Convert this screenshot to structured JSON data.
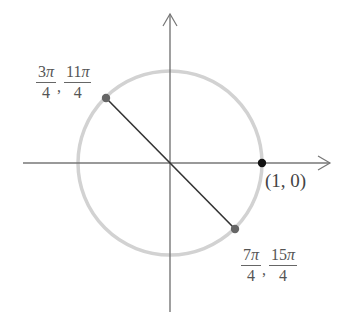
{
  "diagram": {
    "type": "unit-circle",
    "colors": {
      "axes": "#777777",
      "circle": "#cccccc",
      "segment": "#333333",
      "point_gray": "#666666",
      "point_black": "#111111",
      "text": "#555555"
    },
    "points": [
      {
        "id": "upper-left",
        "label_parts": [
          {
            "num": "3",
            "sym": "π",
            "den": "4"
          },
          {
            "num": "11",
            "sym": "π",
            "den": "4"
          }
        ]
      },
      {
        "id": "lower-right",
        "label_parts": [
          {
            "num": "7",
            "sym": "π",
            "den": "4"
          },
          {
            "num": "15",
            "sym": "π",
            "den": "4"
          }
        ]
      },
      {
        "id": "right",
        "label": "(1, 0)"
      }
    ],
    "comma": ","
  }
}
